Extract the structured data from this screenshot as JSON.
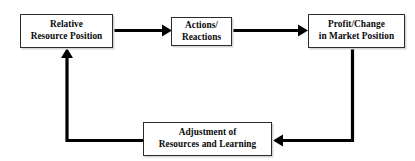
{
  "diagram": {
    "type": "cycle-flow-diagram",
    "background_color": "#ffffff",
    "box_border_color": "#2b2b2b",
    "box_fill_color": "#ffffff",
    "arrow_color": "#000000",
    "text_color": "#0a0a0a",
    "nodes": [
      {
        "id": "relative-resource-position",
        "label": "Relative\nResource Position",
        "line1": "Relative",
        "line2": "Resource Position"
      },
      {
        "id": "actions-reactions",
        "label": "Actions/\nReactions",
        "line1": "Actions/",
        "line2": "Reactions"
      },
      {
        "id": "profit-change",
        "label": "Profit/Change\nin Market Position",
        "line1": "Profit/Change",
        "line2": "in Market Position"
      },
      {
        "id": "adjustment-resources",
        "label": "Adjustment of\nResources and Learning",
        "line1": "Adjustment of",
        "line2": "Resources and Learning"
      }
    ],
    "edges": [
      {
        "id": "edge-resource-to-actions",
        "from": "relative-resource-position",
        "to": "actions-reactions",
        "direction": "right",
        "style": "straight"
      },
      {
        "id": "edge-actions-to-profit",
        "from": "actions-reactions",
        "to": "profit-change",
        "direction": "right",
        "style": "straight"
      },
      {
        "id": "edge-profit-to-adjustment",
        "from": "profit-change",
        "to": "adjustment-resources",
        "direction": "down-then-left",
        "style": "elbow"
      },
      {
        "id": "edge-adjustment-to-resource",
        "from": "adjustment-resources",
        "to": "relative-resource-position",
        "direction": "left-then-up",
        "style": "elbow"
      }
    ]
  }
}
